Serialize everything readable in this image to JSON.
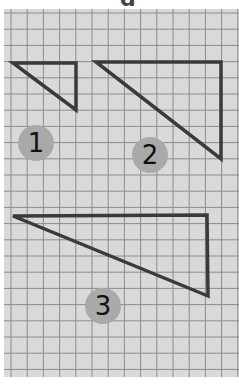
{
  "header": {
    "fragment_text": "g"
  },
  "grid": {
    "cell_size": 16.2,
    "line_color": "#8c8c8c",
    "paper_color": "#d9d9d9"
  },
  "triangles": [
    {
      "id": 1,
      "label": "1",
      "points": "13,63 76,63 76,110"
    },
    {
      "id": 2,
      "label": "2",
      "points": "96,62 221,62 221,159"
    },
    {
      "id": 3,
      "label": "3",
      "points": "13,216 207,215 208,296"
    }
  ],
  "badges": [
    {
      "label": "1",
      "cx": 36,
      "cy": 143
    },
    {
      "label": "2",
      "cx": 150,
      "cy": 155
    },
    {
      "label": "3",
      "cx": 103,
      "cy": 306
    }
  ],
  "stroke_color": "#3a3a3a"
}
